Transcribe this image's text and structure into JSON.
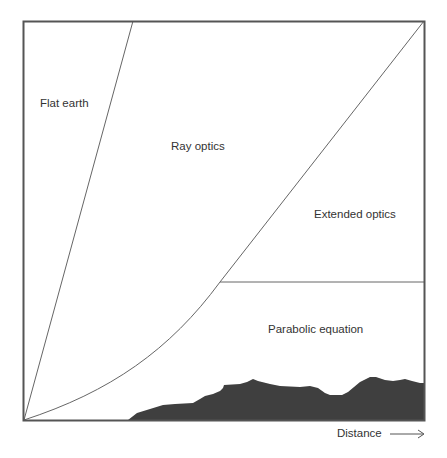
{
  "diagram": {
    "type": "propagation-regions",
    "regions": [
      {
        "id": "flat-earth",
        "label": "Flat earth"
      },
      {
        "id": "ray-optics",
        "label": "Ray optics"
      },
      {
        "id": "extended-optics",
        "label": "Extended optics"
      },
      {
        "id": "parabolic-equation",
        "label": "Parabolic equation"
      }
    ],
    "x_axis": {
      "label": "Distance",
      "arrow": "right-arrow"
    },
    "terrain": {
      "description": "dark terrain profile along bottom"
    },
    "colors": {
      "frame": "#555555",
      "lines": "#666666",
      "terrain": "#3f3f3f",
      "text": "#333333",
      "background": "#ffffff"
    }
  }
}
